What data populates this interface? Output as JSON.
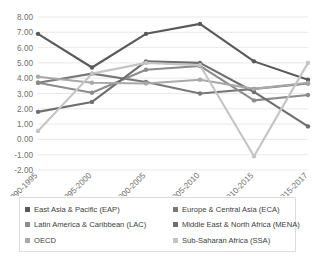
{
  "chart_data": {
    "type": "line",
    "title": "",
    "xlabel": "",
    "ylabel": "",
    "ylim": [
      -2.0,
      8.0
    ],
    "ytick_step": 1.0,
    "grid": true,
    "legend_position": "bottom",
    "categories": [
      "1990-1995",
      "1995-2000",
      "2000-2005",
      "2005-2010",
      "2010-2015",
      "2015-2017"
    ],
    "ytick_labels": [
      "8.00",
      "7.00",
      "6.00",
      "5.00",
      "4.00",
      "3.00",
      "2.00",
      "1.00",
      "0.00",
      "-1.00",
      "-2.00"
    ],
    "series": [
      {
        "name": "East Asia & Pacific (EAP)",
        "color": "#595959",
        "values": [
          6.9,
          4.7,
          6.9,
          7.55,
          5.1,
          3.9
        ]
      },
      {
        "name": "Europe & Central Asia (ECA)",
        "color": "#787878",
        "values": [
          3.7,
          4.3,
          3.75,
          3.0,
          3.3,
          3.65
        ]
      },
      {
        "name": "Latin America & Caribbean (LAC)",
        "color": "#8c8c8c",
        "values": [
          3.7,
          3.05,
          4.55,
          4.8,
          2.55,
          2.9
        ]
      },
      {
        "name": "Middle East & North Africa (MENA)",
        "color": "#6e6e6e",
        "values": [
          1.8,
          2.45,
          5.1,
          5.0,
          3.1,
          0.85
        ]
      },
      {
        "name": "OECD",
        "color": "#a8a8a8",
        "values": [
          4.1,
          3.7,
          3.65,
          3.9,
          3.3,
          3.7
        ]
      },
      {
        "name": "Sub-Saharan Africa (SSA)",
        "color": "#c4c4c4",
        "values": [
          0.55,
          4.3,
          5.0,
          4.85,
          -1.1,
          5.0
        ]
      }
    ]
  },
  "legend": {
    "items": [
      {
        "label": "East Asia & Pacific (EAP)",
        "color": "#595959",
        "marker": "square"
      },
      {
        "label": "Europe & Central Asia (ECA)",
        "color": "#787878",
        "marker": "square"
      },
      {
        "label": "Latin America & Caribbean (LAC)",
        "color": "#8c8c8c",
        "marker": "square"
      },
      {
        "label": "Middle East & North Africa (MENA)",
        "color": "#6e6e6e",
        "marker": "square"
      },
      {
        "label": "OECD",
        "color": "#a8a8a8",
        "marker": "square"
      },
      {
        "label": "Sub-Saharan Africa (SSA)",
        "color": "#c4c4c4",
        "marker": "square"
      }
    ]
  }
}
